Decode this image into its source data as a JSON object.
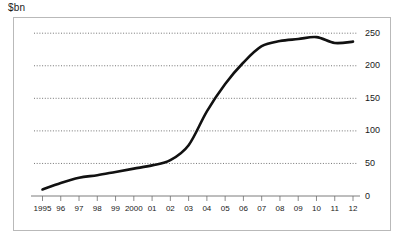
{
  "units_label": "$bn",
  "chart_data": {
    "type": "line",
    "title": "",
    "subtitle": "",
    "xlabel": "",
    "ylabel": "$bn",
    "units": "$bn",
    "categories": [
      "1995",
      "96",
      "97",
      "98",
      "99",
      "2000",
      "01",
      "02",
      "03",
      "04",
      "05",
      "06",
      "07",
      "08",
      "09",
      "10",
      "11",
      "12"
    ],
    "x": [
      1995,
      1996,
      1997,
      1998,
      1999,
      2000,
      2001,
      2002,
      2003,
      2004,
      2005,
      2006,
      2007,
      2008,
      2009,
      2010,
      2011,
      2012
    ],
    "values": [
      10,
      20,
      28,
      32,
      37,
      42,
      47,
      55,
      78,
      130,
      172,
      205,
      230,
      238,
      241,
      244,
      235,
      237
    ],
    "series": [
      {
        "name": "$bn",
        "values": [
          10,
          20,
          28,
          32,
          37,
          42,
          47,
          55,
          78,
          130,
          172,
          205,
          230,
          238,
          241,
          244,
          235,
          237
        ]
      }
    ],
    "ylim": [
      0,
      250
    ],
    "yticks": [
      0,
      50,
      100,
      150,
      200,
      250
    ],
    "ytick_labels": [
      "0",
      "50",
      "100",
      "150",
      "200",
      "250"
    ],
    "xlim": [
      1995,
      2012
    ],
    "grid": true,
    "grid_axis": "y",
    "legend": false,
    "legend_position": "none",
    "y_axis_position": "right",
    "line_color": "#111111",
    "grid_color": "#3a3a3a",
    "axis_color": "#6e6e6e",
    "frame_color": "#b9b9b9",
    "background_color": "#ffffff"
  }
}
